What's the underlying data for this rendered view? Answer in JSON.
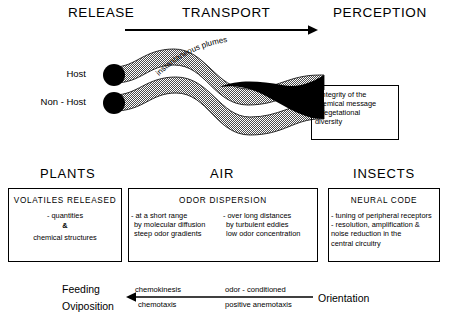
{
  "header": {
    "release": "RELEASE",
    "transport": "TRANSPORT",
    "perception": "PERCEPTION",
    "arrow_icon": "arrow-right-icon"
  },
  "plume": {
    "caption": "instantaneous plumes",
    "source_labels": [
      {
        "label": "Host"
      },
      {
        "label": "Non - Host"
      }
    ],
    "colors": {
      "hatch": "#808080",
      "core": "#000000",
      "source_dot": "#000000"
    }
  },
  "perception_box": {
    "lines": [
      "- Integrity of the",
      "  chemical message",
      "- Vegetational",
      "  diversity"
    ]
  },
  "sections": {
    "plants": "PLANTS",
    "air": "AIR",
    "insects": "INSECTS"
  },
  "plants_box": {
    "title": "VOLATILES  RELEASED",
    "lines": [
      "- quantities",
      "&",
      "chemical  structures"
    ]
  },
  "air_box": {
    "title": "ODOR  DISPERSION",
    "left_column": [
      "- at a short range",
      "by molecular diffusion",
      "steep odor gradients"
    ],
    "right_column": [
      "- over long distances",
      "by turbulent eddies",
      "low odor concentration"
    ]
  },
  "insects_box": {
    "title": "NEURAL  CODE",
    "lines": [
      "- tuning of peripheral receptors",
      "- resolution, amplification &",
      "  noise reduction in the",
      "  central circuitry"
    ]
  },
  "bottom": {
    "left_label_line1": "Feeding",
    "left_label_line2": "Oviposition",
    "mid_left_top": "chemokinesis",
    "mid_left_bottom": "chemotaxis",
    "mid_right_top": "odor - conditioned",
    "mid_right_bottom": "positive anemotaxis",
    "right_label": "Orientation",
    "arrow_icon": "arrow-left-icon"
  }
}
